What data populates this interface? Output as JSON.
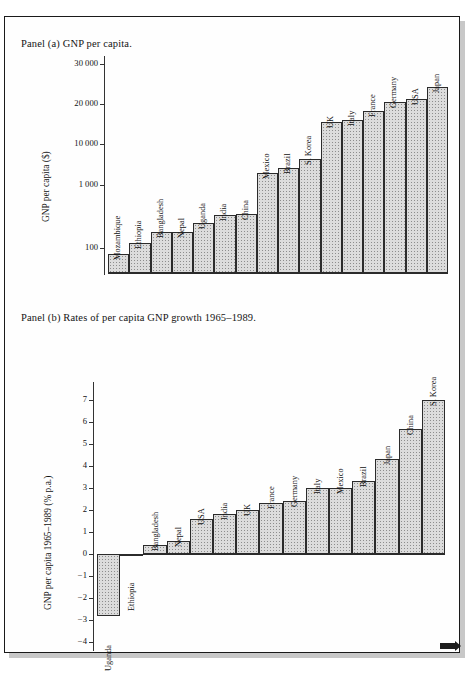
{
  "figure": {
    "panel_a_caption": "Panel (a) GNP per capita.",
    "panel_b_caption": "Panel (b)  Rates of per capita GNP growth 1965–1989."
  },
  "chart_data": [
    {
      "type": "bar",
      "id": "panel-a",
      "title": "Panel (a) GNP per capita.",
      "xlabel": "",
      "ylabel": "GNP per capita ($)",
      "scale": "log-like",
      "grid": false,
      "legend": "none",
      "ytick_labels": [
        "100",
        "1 000",
        "10 000",
        "20 000",
        "30 000"
      ],
      "ytick_values": [
        100,
        1000,
        10000,
        20000,
        30000
      ],
      "categories": [
        "Mozambique",
        "Ethiopia",
        "Bangladesh",
        "Nepal",
        "Uganda",
        "India",
        "China",
        "Mexico",
        "Brazil",
        "S. Korea",
        "UK",
        "Italy",
        "France",
        "Germany",
        "USA",
        "Japan"
      ],
      "values": [
        80,
        120,
        180,
        180,
        250,
        340,
        350,
        2010,
        2540,
        4400,
        14610,
        15120,
        17820,
        20440,
        21100,
        23810
      ]
    },
    {
      "type": "bar",
      "id": "panel-b",
      "title": "Panel (b)  Rates of per capita GNP growth 1965–1989.",
      "xlabel": "",
      "ylabel": "GNP per capita 1965–1989 (% p.a.)",
      "grid": false,
      "legend": "none",
      "ylim": [
        -4,
        7.6
      ],
      "ytick_labels": [
        "7",
        "6",
        "5",
        "4",
        "3",
        "2",
        "1",
        "0",
        "−1",
        "−2",
        "−3",
        "−4"
      ],
      "ytick_values": [
        7,
        6,
        5,
        4,
        3,
        2,
        1,
        0,
        -1,
        -2,
        -3,
        -4
      ],
      "categories": [
        "Uganda",
        "Ethiopia",
        "Bangladesh",
        "Nepal",
        "USA",
        "India",
        "UK",
        "France",
        "Germany",
        "Italy",
        "Mexico",
        "Brazil",
        "Japan",
        "China",
        "S. Korea"
      ],
      "values": [
        -2.8,
        -0.1,
        0.4,
        0.6,
        1.6,
        1.8,
        2.0,
        2.3,
        2.4,
        3.0,
        3.0,
        3.3,
        4.3,
        5.7,
        7.0
      ]
    }
  ]
}
